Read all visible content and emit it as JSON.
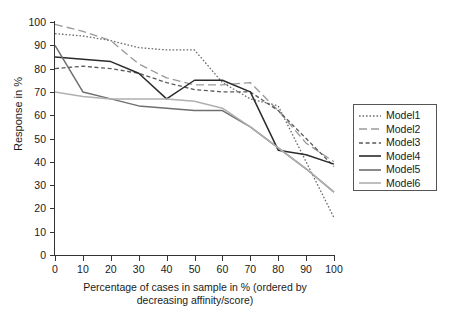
{
  "chart_data": {
    "type": "line",
    "title": "",
    "xlabel": "Percentage of cases in sample in % (ordered by decreasing affinity/score)",
    "xlabel_line1": "Percentage of cases in sample in % (ordered by",
    "xlabel_line2": "decreasing affinity/score)",
    "ylabel": "Response in %",
    "xlim": [
      0,
      100
    ],
    "ylim": [
      0,
      100
    ],
    "grid": false,
    "legend_position": "right",
    "x": [
      0,
      10,
      20,
      30,
      40,
      50,
      60,
      70,
      80,
      90,
      100
    ],
    "xticks": [
      "0",
      "10",
      "20",
      "30",
      "40",
      "50",
      "60",
      "70",
      "80",
      "90",
      "100"
    ],
    "yticks": [
      "0",
      "10",
      "20",
      "30",
      "40",
      "50",
      "60",
      "70",
      "80",
      "90",
      "100"
    ],
    "series": [
      {
        "name": "Model1",
        "style": "dotted",
        "color": "#6b6b6b",
        "values": [
          95,
          94,
          92,
          89,
          88,
          88,
          74,
          67,
          64,
          40,
          16
        ]
      },
      {
        "name": "Model2",
        "style": "long-dash",
        "color": "#9a9a9a",
        "values": [
          99,
          96,
          92,
          82,
          76,
          73,
          73,
          74,
          62,
          48,
          40
        ]
      },
      {
        "name": "Model3",
        "style": "short-dash",
        "color": "#5a5a5a",
        "values": [
          80,
          81,
          80,
          78,
          74,
          71,
          70,
          70,
          62,
          50,
          38
        ]
      },
      {
        "name": "Model4",
        "style": "solid",
        "color": "#2b2b2b",
        "values": [
          85,
          84,
          83,
          78,
          67,
          75,
          75,
          70,
          45,
          43,
          39
        ]
      },
      {
        "name": "Model5",
        "style": "solid",
        "color": "#6f6f6f",
        "values": [
          90,
          70,
          67,
          64,
          63,
          62,
          62,
          55,
          46,
          37,
          27
        ]
      },
      {
        "name": "Model6",
        "style": "solid",
        "color": "#b0b0b0",
        "values": [
          70,
          68,
          67,
          67,
          67,
          66,
          63,
          55,
          46,
          37,
          27
        ]
      }
    ]
  },
  "legend": {
    "items": [
      {
        "label": "Model1"
      },
      {
        "label": "Model2"
      },
      {
        "label": "Model3"
      },
      {
        "label": "Model4"
      },
      {
        "label": "Model5"
      },
      {
        "label": "Model6"
      }
    ]
  }
}
